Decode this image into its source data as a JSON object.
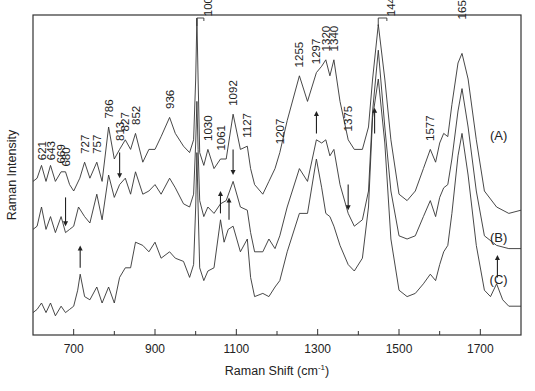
{
  "chart_data": {
    "type": "line",
    "title": "",
    "xlabel": "Raman Shift (cm-1)",
    "xlabel_main": "Raman Shift (cm",
    "xlabel_sup": "-1",
    "xlabel_close": ")",
    "ylabel": "Raman Intensity",
    "xlim": [
      600,
      1800
    ],
    "ylim": [
      0,
      100
    ],
    "x_ticks_major": [
      700,
      900,
      1100,
      1300,
      1500,
      1700
    ],
    "x_tick_labels": [
      "700",
      "900",
      "1100",
      "1300",
      "1500",
      "1700"
    ],
    "x_ticks_minor": [
      800,
      1000,
      1200,
      1400,
      1600
    ],
    "y_ticks": [],
    "grid": false,
    "legend": "none",
    "series": [
      {
        "name": "(A)",
        "label_at": [
          1745,
          61
        ],
        "points": [
          [
            600,
            48
          ],
          [
            610,
            49
          ],
          [
            621,
            53
          ],
          [
            632,
            48
          ],
          [
            643,
            53
          ],
          [
            655,
            48
          ],
          [
            669,
            51
          ],
          [
            680,
            51
          ],
          [
            690,
            47
          ],
          [
            700,
            45
          ],
          [
            715,
            49
          ],
          [
            727,
            54
          ],
          [
            740,
            49
          ],
          [
            757,
            54
          ],
          [
            770,
            48
          ],
          [
            786,
            65
          ],
          [
            800,
            55
          ],
          [
            813,
            58
          ],
          [
            827,
            61
          ],
          [
            840,
            58
          ],
          [
            852,
            63
          ],
          [
            870,
            54
          ],
          [
            885,
            58
          ],
          [
            900,
            58
          ],
          [
            915,
            62
          ],
          [
            936,
            68
          ],
          [
            950,
            63
          ],
          [
            970,
            59
          ],
          [
            985,
            57
          ],
          [
            995,
            61
          ],
          [
            1000,
            80
          ],
          [
            1003,
            99
          ],
          [
            1006,
            80
          ],
          [
            1010,
            57
          ],
          [
            1020,
            53
          ],
          [
            1030,
            58
          ],
          [
            1045,
            52
          ],
          [
            1061,
            55
          ],
          [
            1075,
            55
          ],
          [
            1092,
            69
          ],
          [
            1110,
            58
          ],
          [
            1127,
            59
          ],
          [
            1135,
            52
          ],
          [
            1145,
            47
          ],
          [
            1165,
            44
          ],
          [
            1180,
            48
          ],
          [
            1195,
            52
          ],
          [
            1207,
            57
          ],
          [
            1225,
            67
          ],
          [
            1255,
            81
          ],
          [
            1275,
            73
          ],
          [
            1297,
            82
          ],
          [
            1310,
            84
          ],
          [
            1320,
            86
          ],
          [
            1330,
            81
          ],
          [
            1340,
            86
          ],
          [
            1355,
            73
          ],
          [
            1375,
            61
          ],
          [
            1390,
            58
          ],
          [
            1410,
            58
          ],
          [
            1425,
            65
          ],
          [
            1435,
            80
          ],
          [
            1449,
            97
          ],
          [
            1465,
            80
          ],
          [
            1480,
            61
          ],
          [
            1500,
            44
          ],
          [
            1520,
            42
          ],
          [
            1540,
            45
          ],
          [
            1560,
            52
          ],
          [
            1577,
            58
          ],
          [
            1590,
            54
          ],
          [
            1600,
            60
          ],
          [
            1610,
            63
          ],
          [
            1620,
            62
          ],
          [
            1630,
            72
          ],
          [
            1645,
            85
          ],
          [
            1655,
            88
          ],
          [
            1670,
            80
          ],
          [
            1690,
            61
          ],
          [
            1710,
            45
          ],
          [
            1740,
            40
          ],
          [
            1770,
            38
          ],
          [
            1800,
            39
          ]
        ]
      },
      {
        "name": "(B)",
        "label_at": [
          1745,
          29
        ],
        "points": [
          [
            600,
            33
          ],
          [
            610,
            34
          ],
          [
            621,
            40
          ],
          [
            632,
            33
          ],
          [
            643,
            37
          ],
          [
            655,
            32
          ],
          [
            669,
            37
          ],
          [
            680,
            32
          ],
          [
            690,
            33
          ],
          [
            700,
            34
          ],
          [
            712,
            40
          ],
          [
            727,
            37
          ],
          [
            740,
            35
          ],
          [
            757,
            44
          ],
          [
            770,
            36
          ],
          [
            786,
            50
          ],
          [
            800,
            43
          ],
          [
            813,
            47
          ],
          [
            827,
            49
          ],
          [
            840,
            44
          ],
          [
            852,
            51
          ],
          [
            870,
            44
          ],
          [
            885,
            45
          ],
          [
            900,
            47
          ],
          [
            915,
            44
          ],
          [
            936,
            49
          ],
          [
            950,
            46
          ],
          [
            970,
            41
          ],
          [
            985,
            40
          ],
          [
            995,
            44
          ],
          [
            1000,
            60
          ],
          [
            1003,
            73
          ],
          [
            1006,
            58
          ],
          [
            1010,
            42
          ],
          [
            1020,
            37
          ],
          [
            1030,
            40
          ],
          [
            1045,
            38
          ],
          [
            1061,
            41
          ],
          [
            1075,
            42
          ],
          [
            1092,
            48
          ],
          [
            1110,
            40
          ],
          [
            1127,
            39
          ],
          [
            1135,
            32
          ],
          [
            1145,
            26
          ],
          [
            1165,
            26
          ],
          [
            1180,
            30
          ],
          [
            1195,
            27
          ],
          [
            1207,
            31
          ],
          [
            1225,
            40
          ],
          [
            1255,
            52
          ],
          [
            1275,
            48
          ],
          [
            1297,
            61
          ],
          [
            1310,
            60
          ],
          [
            1320,
            61
          ],
          [
            1330,
            56
          ],
          [
            1340,
            58
          ],
          [
            1355,
            47
          ],
          [
            1375,
            38
          ],
          [
            1390,
            34
          ],
          [
            1410,
            36
          ],
          [
            1425,
            45
          ],
          [
            1435,
            70
          ],
          [
            1449,
            89
          ],
          [
            1465,
            65
          ],
          [
            1480,
            45
          ],
          [
            1500,
            31
          ],
          [
            1520,
            30
          ],
          [
            1540,
            31
          ],
          [
            1560,
            37
          ],
          [
            1577,
            42
          ],
          [
            1590,
            37
          ],
          [
            1600,
            43
          ],
          [
            1610,
            46
          ],
          [
            1620,
            47
          ],
          [
            1630,
            55
          ],
          [
            1645,
            70
          ],
          [
            1655,
            77
          ],
          [
            1670,
            65
          ],
          [
            1690,
            45
          ],
          [
            1710,
            31
          ],
          [
            1740,
            28
          ],
          [
            1770,
            27
          ],
          [
            1800,
            27
          ]
        ]
      },
      {
        "name": "(C)",
        "label_at": [
          1745,
          16
        ],
        "points": [
          [
            600,
            7
          ],
          [
            610,
            8
          ],
          [
            621,
            10
          ],
          [
            632,
            7
          ],
          [
            643,
            10
          ],
          [
            655,
            6
          ],
          [
            669,
            9
          ],
          [
            680,
            7
          ],
          [
            690,
            8
          ],
          [
            700,
            9
          ],
          [
            710,
            14
          ],
          [
            716,
            19
          ],
          [
            727,
            12
          ],
          [
            740,
            11
          ],
          [
            757,
            15
          ],
          [
            770,
            10
          ],
          [
            786,
            15
          ],
          [
            800,
            10
          ],
          [
            813,
            18
          ],
          [
            827,
            21
          ],
          [
            840,
            21
          ],
          [
            852,
            29
          ],
          [
            870,
            28
          ],
          [
            885,
            26
          ],
          [
            900,
            29
          ],
          [
            915,
            24
          ],
          [
            936,
            26
          ],
          [
            950,
            24
          ],
          [
            970,
            23
          ],
          [
            985,
            18
          ],
          [
            995,
            22
          ],
          [
            1000,
            40
          ],
          [
            1003,
            57
          ],
          [
            1006,
            40
          ],
          [
            1010,
            21
          ],
          [
            1020,
            17
          ],
          [
            1030,
            20
          ],
          [
            1045,
            21
          ],
          [
            1061,
            36
          ],
          [
            1070,
            29
          ],
          [
            1080,
            33
          ],
          [
            1092,
            34
          ],
          [
            1110,
            26
          ],
          [
            1127,
            30
          ],
          [
            1135,
            18
          ],
          [
            1145,
            12
          ],
          [
            1165,
            13
          ],
          [
            1180,
            12
          ],
          [
            1195,
            15
          ],
          [
            1207,
            17
          ],
          [
            1225,
            26
          ],
          [
            1255,
            38
          ],
          [
            1275,
            38
          ],
          [
            1297,
            55
          ],
          [
            1310,
            46
          ],
          [
            1320,
            38
          ],
          [
            1330,
            37
          ],
          [
            1340,
            34
          ],
          [
            1355,
            28
          ],
          [
            1375,
            22
          ],
          [
            1390,
            20
          ],
          [
            1410,
            24
          ],
          [
            1425,
            40
          ],
          [
            1435,
            68
          ],
          [
            1449,
            80
          ],
          [
            1465,
            60
          ],
          [
            1480,
            30
          ],
          [
            1500,
            14
          ],
          [
            1520,
            12
          ],
          [
            1540,
            13
          ],
          [
            1560,
            16
          ],
          [
            1577,
            19
          ],
          [
            1590,
            17
          ],
          [
            1600,
            22
          ],
          [
            1610,
            26
          ],
          [
            1620,
            28
          ],
          [
            1630,
            38
          ],
          [
            1645,
            56
          ],
          [
            1655,
            63
          ],
          [
            1670,
            50
          ],
          [
            1690,
            28
          ],
          [
            1710,
            14
          ],
          [
            1725,
            12
          ],
          [
            1740,
            16
          ],
          [
            1755,
            11
          ],
          [
            1770,
            9
          ],
          [
            1800,
            9
          ]
        ]
      }
    ],
    "peak_labels": [
      {
        "text": "621",
        "x": 621,
        "y": 54
      },
      {
        "text": "643",
        "x": 643,
        "y": 54
      },
      {
        "text": "669",
        "x": 669,
        "y": 53
      },
      {
        "text": "680",
        "x": 680,
        "y": 52
      },
      {
        "text": "727",
        "x": 727,
        "y": 56
      },
      {
        "text": "757",
        "x": 757,
        "y": 56
      },
      {
        "text": "786",
        "x": 786,
        "y": 67
      },
      {
        "text": "813",
        "x": 813,
        "y": 60
      },
      {
        "text": "827",
        "x": 827,
        "y": 63
      },
      {
        "text": "852",
        "x": 852,
        "y": 65
      },
      {
        "text": "936",
        "x": 936,
        "y": 70
      },
      {
        "text": "1003",
        "x": 1030,
        "y": 99
      },
      {
        "text": "1030",
        "x": 1030,
        "y": 60
      },
      {
        "text": "1061",
        "x": 1061,
        "y": 57
      },
      {
        "text": "1092",
        "x": 1092,
        "y": 71
      },
      {
        "text": "1127",
        "x": 1127,
        "y": 61
      },
      {
        "text": "1207",
        "x": 1207,
        "y": 59
      },
      {
        "text": "1255",
        "x": 1255,
        "y": 83
      },
      {
        "text": "1297",
        "x": 1297,
        "y": 84
      },
      {
        "text": "1320",
        "x": 1320,
        "y": 88
      },
      {
        "text": "1340",
        "x": 1340,
        "y": 88
      },
      {
        "text": "1375",
        "x": 1375,
        "y": 63
      },
      {
        "text": "1449",
        "x": 1480,
        "y": 99
      },
      {
        "text": "1577",
        "x": 1577,
        "y": 60
      },
      {
        "text": "1655",
        "x": 1655,
        "y": 98
      }
    ],
    "markers": [
      {
        "x": 680,
        "from": 43,
        "to": 34,
        "direction": "down",
        "series": "(B)"
      },
      {
        "x": 813,
        "from": 57,
        "to": 49,
        "direction": "down",
        "series": "(B)"
      },
      {
        "x": 1092,
        "from": 58,
        "to": 50,
        "direction": "down",
        "series": "(B)"
      },
      {
        "x": 1375,
        "from": 47,
        "to": 39,
        "direction": "down",
        "series": "(B)"
      },
      {
        "x": 716,
        "from": 21,
        "to": 28,
        "direction": "up",
        "series": "(C)"
      },
      {
        "x": 1061,
        "from": 38,
        "to": 45,
        "direction": "up",
        "series": "(C)"
      },
      {
        "x": 1082,
        "from": 36,
        "to": 43,
        "direction": "up",
        "series": "(C)"
      },
      {
        "x": 1297,
        "from": 63,
        "to": 70,
        "direction": "up",
        "series": "(B)"
      },
      {
        "x": 1440,
        "from": 63,
        "to": 71,
        "direction": "up",
        "series": "(B)"
      },
      {
        "x": 1742,
        "from": 18,
        "to": 25,
        "direction": "up",
        "series": "(C)"
      }
    ],
    "brackets": [
      {
        "peak_x": 1003,
        "label_x": 1030,
        "y": 100
      },
      {
        "peak_x": 1449,
        "label_x": 1480,
        "y": 100
      }
    ]
  }
}
